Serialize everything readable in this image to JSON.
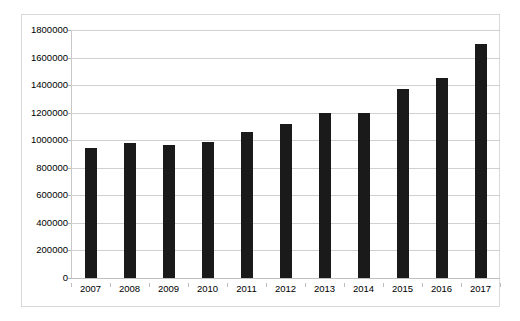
{
  "chart_data": {
    "type": "bar",
    "title": "",
    "subtitle": "",
    "xlabel": "",
    "ylabel": "",
    "categories": [
      "2007",
      "2008",
      "2009",
      "2010",
      "2011",
      "2012",
      "2013",
      "2014",
      "2015",
      "2016",
      "2017"
    ],
    "values": [
      945000,
      980000,
      968000,
      988000,
      1060000,
      1118000,
      1200000,
      1198000,
      1373000,
      1450000,
      1697000
    ],
    "series": [
      {
        "name": "",
        "values": [
          945000,
          980000,
          968000,
          988000,
          1060000,
          1118000,
          1200000,
          1198000,
          1373000,
          1450000,
          1697000
        ]
      }
    ],
    "ylim": [
      0,
      1800000
    ],
    "ytick_values": [
      0,
      200000,
      400000,
      600000,
      800000,
      1000000,
      1200000,
      1400000,
      1600000,
      1800000
    ],
    "ytick_labels": [
      "0",
      "200000",
      "400000",
      "600000",
      "800000",
      "1000000",
      "1200000",
      "1400000",
      "1600000",
      "1800000"
    ],
    "grid": true,
    "grid_axis": "y",
    "legend": false,
    "legend_position": "none",
    "bar_color": "#1a1a1a",
    "gridline_color": "#d0d0d0",
    "background_color": "#ffffff",
    "border_color": "#d9d9d9",
    "annotations": []
  }
}
